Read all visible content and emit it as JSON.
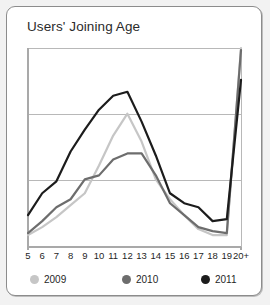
{
  "card": {
    "title": "Users' Joining Age"
  },
  "chart_data": {
    "type": "line",
    "title": "Users' Joining Age",
    "xlabel": "",
    "ylabel": "",
    "grid": true,
    "gridlines": 2,
    "legend_position": "bottom",
    "categories": [
      "5",
      "6",
      "7",
      "8",
      "9",
      "10",
      "11",
      "12",
      "13",
      "14",
      "15",
      "16",
      "17",
      "18",
      "19",
      "20+"
    ],
    "ylim": [
      0,
      100
    ],
    "series": [
      {
        "name": "2009",
        "color": "#c6c6c6",
        "values": [
          6,
          10,
          15,
          21,
          27,
          41,
          56,
          67,
          53,
          34,
          24,
          16,
          9,
          6,
          6,
          100
        ]
      },
      {
        "name": "2010",
        "color": "#6d6d6d",
        "values": [
          7,
          13,
          20,
          24,
          34,
          36,
          44,
          47,
          47,
          36,
          22,
          16,
          10,
          8,
          7,
          99
        ]
      },
      {
        "name": "2011",
        "color": "#1c1c1c",
        "values": [
          16,
          27,
          33,
          48,
          59,
          69,
          76,
          78,
          63,
          46,
          27,
          22,
          20,
          13,
          14,
          84
        ]
      }
    ]
  },
  "legend": {
    "items": [
      {
        "label": "2009",
        "color": "#c6c6c6"
      },
      {
        "label": "2010",
        "color": "#6d6d6d"
      },
      {
        "label": "2011",
        "color": "#1c1c1c"
      }
    ]
  },
  "axes": {
    "plot_left": 28,
    "plot_right": 241,
    "plot_top": 48,
    "plot_bottom": 247,
    "axis_color": "#a9a9a9",
    "grid_color": "#b8b8b8"
  }
}
